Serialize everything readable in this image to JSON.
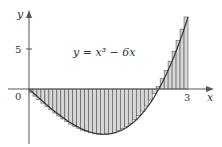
{
  "chart_data": {
    "type": "area",
    "title": "",
    "function_label": "y = x³ − 6x",
    "function": "x^3 - 6x",
    "xlabel": "x",
    "ylabel": "y",
    "x_ticks": [
      {
        "value": 0,
        "label": "0"
      },
      {
        "value": 3,
        "label": "3"
      }
    ],
    "y_ticks": [
      {
        "value": 5,
        "label": "5"
      }
    ],
    "interval": [
      0,
      3
    ],
    "rectangles": {
      "count": 40,
      "sample": "right-endpoint"
    },
    "xlim": [
      0,
      3.4
    ],
    "ylim": [
      -6,
      10
    ],
    "grid": false
  },
  "colors": {
    "axis": "#555555",
    "curve": "#333333",
    "rect_fill": "#d6d6d6",
    "rect_stroke": "#555555"
  }
}
